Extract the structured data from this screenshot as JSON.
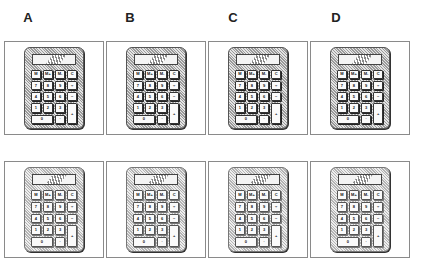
{
  "columns": [
    {
      "label": "A",
      "x": 22
    },
    {
      "label": "B",
      "x": 124
    },
    {
      "label": "C",
      "x": 227
    },
    {
      "label": "D",
      "x": 330
    }
  ],
  "rows": [
    {
      "panel_top": 41,
      "panel_height": 94
    },
    {
      "panel_top": 161,
      "panel_height": 97
    }
  ],
  "panels": [
    {
      "col": "A",
      "row": 1,
      "variant": "dark"
    },
    {
      "col": "B",
      "row": 1,
      "variant": "dark"
    },
    {
      "col": "C",
      "row": 1,
      "variant": "dark"
    },
    {
      "col": "D",
      "row": 1,
      "variant": "dark"
    },
    {
      "col": "A",
      "row": 2,
      "variant": "light"
    },
    {
      "col": "B",
      "row": 2,
      "variant": "light"
    },
    {
      "col": "C",
      "row": 2,
      "variant": "light"
    },
    {
      "col": "D",
      "row": 2,
      "variant": "light"
    }
  ],
  "calculator": {
    "keys": [
      {
        "label": "M",
        "type": "normal"
      },
      {
        "label": "M+",
        "type": "normal"
      },
      {
        "label": "M-",
        "type": "normal"
      },
      {
        "label": "C",
        "type": "normal"
      },
      {
        "label": "7",
        "type": "normal"
      },
      {
        "label": "8",
        "type": "normal"
      },
      {
        "label": "9",
        "type": "normal"
      },
      {
        "label": "÷",
        "type": "normal"
      },
      {
        "label": "4",
        "type": "normal"
      },
      {
        "label": "5",
        "type": "normal"
      },
      {
        "label": "6",
        "type": "normal"
      },
      {
        "label": "−",
        "type": "normal"
      },
      {
        "label": "1",
        "type": "normal"
      },
      {
        "label": "2",
        "type": "normal"
      },
      {
        "label": "3",
        "type": "normal"
      },
      {
        "label": "+",
        "type": "tall"
      },
      {
        "label": "0",
        "type": "wide"
      },
      {
        "label": "·",
        "type": "normal"
      }
    ]
  },
  "colors": {
    "panel_border": "#8a8a8a",
    "body_hatch_dark": "#9a9a9a",
    "body_hatch_light": "#e4e4e4",
    "key_face": "#fafafa",
    "outline": "#333333"
  }
}
